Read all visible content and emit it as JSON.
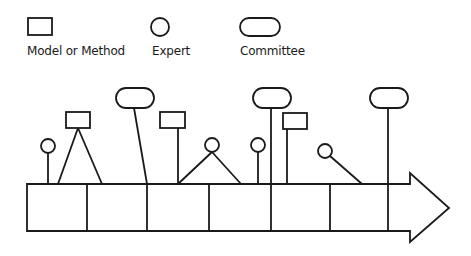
{
  "legend": {
    "items": [
      {
        "shape": "rectangle",
        "label": "Model or Method"
      },
      {
        "shape": "circle",
        "label": "Expert"
      },
      {
        "shape": "rounded-rectangle",
        "label": "Committee"
      }
    ]
  },
  "diagram": {
    "type": "timeline-arrow",
    "segments": 7,
    "stroke_color": "#1a1a1a",
    "markers": [
      {
        "type": "expert",
        "connects_to": "segment-1"
      },
      {
        "type": "model",
        "connects_to": "segment-1 (two legs)"
      },
      {
        "type": "committee",
        "connects_to": "divider-2"
      },
      {
        "type": "model",
        "connects_to": "divider-3"
      },
      {
        "type": "expert",
        "connects_to": "segment-3/4 (two legs)"
      },
      {
        "type": "expert",
        "connects_to": "segment-5"
      },
      {
        "type": "committee",
        "connects_to": "divider-5"
      },
      {
        "type": "model",
        "connects_to": "segment-5"
      },
      {
        "type": "expert",
        "connects_to": "segment-6"
      },
      {
        "type": "committee",
        "connects_to": "divider-7"
      }
    ]
  }
}
